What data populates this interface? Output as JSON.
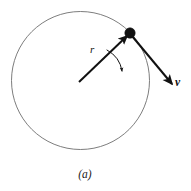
{
  "figure": {
    "caption": "(a)",
    "background_color": "#ffffff",
    "stroke_color": "#111111",
    "circle_stroke_color": "#6e6e6e",
    "labels": {
      "radius": "r",
      "velocity": "v"
    },
    "icon_names": {
      "particle": "particle-dot-icon",
      "rotation": "rotation-arc-arrow-icon",
      "radius_vector": "radius-vector-arrow-icon",
      "velocity_vector": "velocity-vector-arrow-icon",
      "orbit": "orbit-circle-icon"
    }
  },
  "chart_data": {
    "type": "diagram",
    "title": "(a)",
    "circle": {
      "center_x": 80.5,
      "center_y": 80.5,
      "radius": 69,
      "stroke_width": 0.9,
      "stroke": "#6e6e6e",
      "fill": "none"
    },
    "particle": {
      "x": 130,
      "y": 33,
      "radius": 5.2,
      "fill": "#111111"
    },
    "vectors": [
      {
        "name": "r",
        "label": "r",
        "from_x": 79,
        "from_y": 82,
        "to_x": 127,
        "to_y": 36,
        "label_x": 94,
        "label_y": 50,
        "bold": false,
        "stroke_width": 2.0
      },
      {
        "name": "v",
        "label": "v",
        "from_x": 132,
        "from_y": 36,
        "to_x": 172,
        "to_y": 84,
        "label_x": 179,
        "label_y": 83,
        "bold": true,
        "stroke_width": 2.0
      }
    ],
    "rotation_arc": {
      "start_x": 107,
      "start_y": 50,
      "end_x": 122,
      "end_y": 71,
      "control_x": 120,
      "control_y": 57,
      "direction": "clockwise",
      "stroke_width": 1.0
    },
    "axis_ranges": {
      "x": [
        0,
        191
      ],
      "y": [
        0,
        191
      ]
    },
    "grid": false,
    "legend": "none"
  }
}
